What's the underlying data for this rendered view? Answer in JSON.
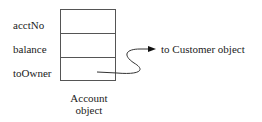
{
  "diagram": {
    "fields": [
      {
        "label": "acctNo"
      },
      {
        "label": "balance"
      },
      {
        "label": "toOwner"
      }
    ],
    "caption_line1": "Account",
    "caption_line2": "object",
    "pointer_target": "to Customer object"
  }
}
